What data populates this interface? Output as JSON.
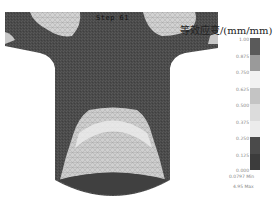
{
  "figure": {
    "step_label": "Step  61",
    "legend_title": "等效应变/(mm/mm)",
    "legend": {
      "ticks": [
        "1.00",
        "0.875",
        "0.750",
        "0.625",
        "0.500",
        "0.375",
        "0.250",
        "0.125",
        "0.000"
      ],
      "band_colors": [
        "#5a5a5a",
        "#9a9a9a",
        "#f2f2f2",
        "#c4c4c4",
        "#dcdcdc",
        "#ececec",
        "#4a4a4a",
        "#3c3c3c"
      ],
      "min_label": "0.0797  Min",
      "max_label": "4.95  Max"
    },
    "colors": {
      "workpiece_base": "#4d4d4d",
      "high_strain": "#d8d8d8",
      "mid_strain": "#bdbdbd"
    }
  }
}
